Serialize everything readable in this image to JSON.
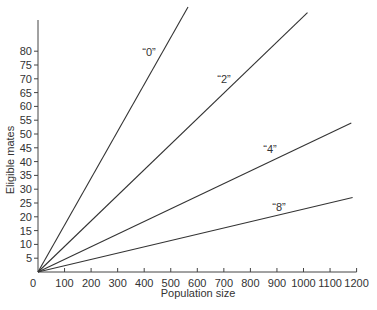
{
  "chart_data": {
    "type": "line",
    "title": "",
    "xlabel": "Population size",
    "ylabel": "Eligible mates",
    "xlim": [
      0,
      1200
    ],
    "ylim": [
      0,
      100
    ],
    "x_ticks": [
      "0",
      "100",
      "200",
      "300",
      "400",
      "500",
      "600",
      "700",
      "800",
      "900",
      "1000",
      "1100",
      "1200"
    ],
    "y_ticks": [
      "5",
      "10",
      "15",
      "20",
      "25",
      "30",
      "35",
      "40",
      "45",
      "50",
      "55",
      "60",
      "65",
      "70",
      "75",
      "80"
    ],
    "grid": false,
    "legend": "inline labels",
    "series": [
      {
        "name": "“0”",
        "x": [
          0,
          565
        ],
        "y": [
          0,
          96
        ]
      },
      {
        "name": "“2”",
        "x": [
          0,
          1015
        ],
        "y": [
          0,
          94
        ]
      },
      {
        "name": "“4”",
        "x": [
          0,
          1180
        ],
        "y": [
          0,
          54
        ]
      },
      {
        "name": "“8”",
        "x": [
          0,
          1185
        ],
        "y": [
          0,
          27
        ]
      }
    ]
  }
}
